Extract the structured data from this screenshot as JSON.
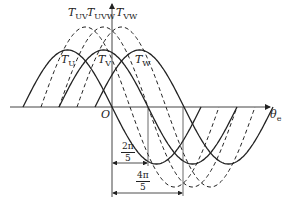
{
  "diagram": {
    "axes": {
      "x_label": "θ",
      "x_label_sub": "e",
      "origin_label": "O"
    },
    "solid_curves": [
      {
        "name": "T",
        "sub": "U",
        "zero_rise_x": 23
      },
      {
        "name": "T",
        "sub": "V",
        "zero_rise_x": 59
      },
      {
        "name": "T",
        "sub": "W",
        "zero_rise_x": 95
      }
    ],
    "dashed_curves": [
      {
        "name": "T",
        "sub": "UV",
        "zero_rise_x": 41
      },
      {
        "name": "T",
        "sub": "UVW",
        "zero_rise_x": 59
      },
      {
        "name": "T",
        "sub": "VW",
        "zero_rise_x": 77
      }
    ],
    "dimensions": [
      {
        "num": "2π",
        "den": "5"
      },
      {
        "num": "4π",
        "den": "5"
      }
    ],
    "colors": {
      "line": "#222222",
      "axis": "#444444"
    }
  }
}
